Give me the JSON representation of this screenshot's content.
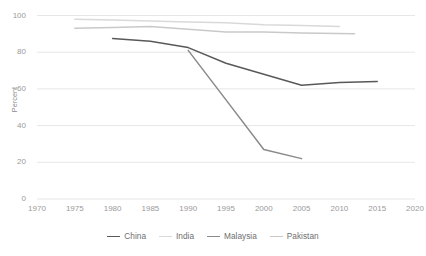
{
  "chart_data": {
    "type": "line",
    "title": "",
    "xlabel": "",
    "ylabel": "Percent",
    "xlim": [
      1970,
      2020
    ],
    "ylim": [
      0,
      100
    ],
    "grid": "horizontal",
    "legend_position": "bottom",
    "x_ticks": [
      "1970",
      "1975",
      "1980",
      "1985",
      "1990",
      "1995",
      "2000",
      "2005",
      "2010",
      "2015",
      "2020"
    ],
    "y_ticks": [
      "0",
      "20",
      "40",
      "60",
      "80",
      "100"
    ],
    "series": [
      {
        "name": "China",
        "color": "#595959",
        "x": [
          1980,
          1985,
          1990,
          1995,
          2000,
          2005,
          2010,
          2015
        ],
        "values": [
          87.5,
          86,
          82.5,
          74,
          68,
          62,
          63.5,
          64
        ]
      },
      {
        "name": "India",
        "color": "#d9d9d9",
        "x": [
          1975,
          1980,
          1985,
          1990,
          1995,
          2000,
          2005,
          2010
        ],
        "values": [
          98,
          97.5,
          97,
          96.5,
          96,
          95,
          94.5,
          94
        ]
      },
      {
        "name": "Malaysia",
        "color": "#8a8a8a",
        "x": [
          1990,
          1995,
          2000,
          2005
        ],
        "values": [
          81,
          54,
          27,
          22
        ]
      },
      {
        "name": "Pakistan",
        "color": "#c9c9c9",
        "x": [
          1975,
          1980,
          1985,
          1990,
          1995,
          2000,
          2005,
          2012
        ],
        "values": [
          93,
          93.5,
          94,
          92.5,
          91,
          91,
          90.5,
          90
        ]
      }
    ]
  },
  "legend": {
    "items": [
      {
        "label": "China"
      },
      {
        "label": "India"
      },
      {
        "label": "Malaysia"
      },
      {
        "label": "Pakistan"
      }
    ]
  }
}
